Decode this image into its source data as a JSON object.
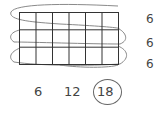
{
  "diagram": {
    "type": "array-multiplication",
    "rows": 3,
    "columns": 6,
    "row_labels": [
      "6",
      "6",
      "6"
    ],
    "skip_count": [
      "6",
      "12",
      "18"
    ],
    "circled_answer_index": 2,
    "colors": {
      "grid": "#333333",
      "loop": "#888888",
      "text": "#444444"
    }
  }
}
